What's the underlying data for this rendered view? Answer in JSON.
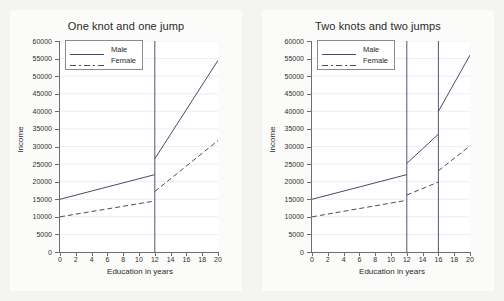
{
  "figure": {
    "background_color": "#f4f4f2",
    "panel_background_color": "#fbfbfa",
    "plot_background_color": "#ffffff",
    "line_color": "#4a4a6a",
    "axis_color": "#6e6e6e",
    "grid_color": "#eeeef2"
  },
  "chart_data": [
    {
      "type": "line",
      "title": "One knot and one jump",
      "xlabel": "Education in years",
      "ylabel": "Income",
      "xlim": [
        0,
        20
      ],
      "ylim": [
        0,
        60000
      ],
      "xticks": [
        0,
        2,
        4,
        6,
        8,
        10,
        12,
        14,
        16,
        18,
        20
      ],
      "yticks": [
        0,
        5000,
        10000,
        15000,
        20000,
        25000,
        30000,
        35000,
        40000,
        45000,
        50000,
        55000,
        60000
      ],
      "grid": true,
      "legend_position": "upper left",
      "knots": [
        12
      ],
      "vlines": [
        12
      ],
      "series": [
        {
          "name": "Male",
          "style": "solid",
          "x": [
            0,
            12,
            12,
            20
          ],
          "values": [
            15000,
            22000,
            26500,
            54500
          ]
        },
        {
          "name": "Female",
          "style": "dashed",
          "x": [
            0,
            12,
            12,
            20
          ],
          "values": [
            10000,
            14500,
            17200,
            31700
          ]
        }
      ]
    },
    {
      "type": "line",
      "title": "Two knots and two jumps",
      "xlabel": "Education in years",
      "ylabel": "Income",
      "xlim": [
        0,
        20
      ],
      "ylim": [
        0,
        60000
      ],
      "xticks": [
        0,
        2,
        4,
        6,
        8,
        10,
        12,
        14,
        16,
        18,
        20
      ],
      "yticks": [
        0,
        5000,
        10000,
        15000,
        20000,
        25000,
        30000,
        35000,
        40000,
        45000,
        50000,
        55000,
        60000
      ],
      "grid": true,
      "legend_position": "upper left",
      "knots": [
        12,
        16
      ],
      "vlines": [
        12,
        16
      ],
      "series": [
        {
          "name": "Male",
          "style": "solid",
          "x": [
            0,
            12,
            12,
            16,
            16,
            20
          ],
          "values": [
            15000,
            22000,
            25200,
            33500,
            40000,
            56000
          ]
        },
        {
          "name": "Female",
          "style": "dashed",
          "x": [
            0,
            12,
            12,
            16,
            16,
            20
          ],
          "values": [
            10000,
            14700,
            16200,
            19900,
            23100,
            30200
          ]
        }
      ]
    }
  ],
  "panels": [
    {
      "title": "One knot and one jump",
      "xlabel": "Education in years",
      "ylabel": "Income",
      "ytick_labels": [
        "60000",
        "55000",
        "50000",
        "45000",
        "40000",
        "35000",
        "30000",
        "25000",
        "20000",
        "15000",
        "10000",
        "5000",
        "0"
      ],
      "xtick_labels": [
        "0",
        "2",
        "4",
        "6",
        "8",
        "10",
        "12",
        "14",
        "16",
        "18",
        "20"
      ],
      "legend": [
        {
          "label": "Male",
          "style": "solid"
        },
        {
          "label": "Female",
          "style": "dashed"
        }
      ]
    },
    {
      "title": "Two knots and two jumps",
      "xlabel": "Education in years",
      "ylabel": "Income",
      "ytick_labels": [
        "60000",
        "55000",
        "50000",
        "45000",
        "40000",
        "35000",
        "30000",
        "25000",
        "20000",
        "15000",
        "10000",
        "5000",
        "0"
      ],
      "xtick_labels": [
        "0",
        "2",
        "4",
        "6",
        "8",
        "10",
        "12",
        "14",
        "16",
        "18",
        "20"
      ],
      "legend": [
        {
          "label": "Male",
          "style": "solid"
        },
        {
          "label": "Female",
          "style": "dashed"
        }
      ]
    }
  ]
}
